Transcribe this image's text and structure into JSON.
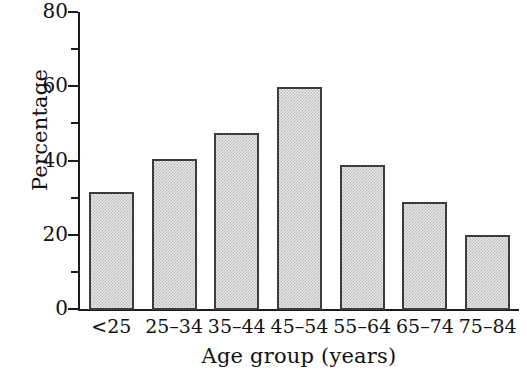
{
  "chart_data": {
    "type": "bar",
    "title": "",
    "xlabel": "Age group (years)",
    "ylabel": "Percentage",
    "categories": [
      "<25",
      "25–34",
      "35–44",
      "45–54",
      "55–64",
      "65–74",
      "75–84"
    ],
    "values": [
      31.5,
      40.3,
      47.5,
      59.7,
      38.8,
      28.8,
      20.0
    ],
    "ylim": [
      0,
      80
    ],
    "yticks": [
      0,
      20,
      40,
      60,
      80
    ],
    "ytick_labels": [
      "0",
      "20",
      "40",
      "60",
      "80"
    ],
    "yminor_ticks": [
      10,
      30,
      50,
      70
    ],
    "grid": false,
    "legend": false,
    "bar_fill_color": "#d8d8d8",
    "bar_edge_color": "#3c3c3c",
    "background_color": "#ffffff",
    "axis_color": "#1b1b1b"
  },
  "axes": {
    "y_title": "Percentage",
    "x_title": "Age group (years)"
  }
}
